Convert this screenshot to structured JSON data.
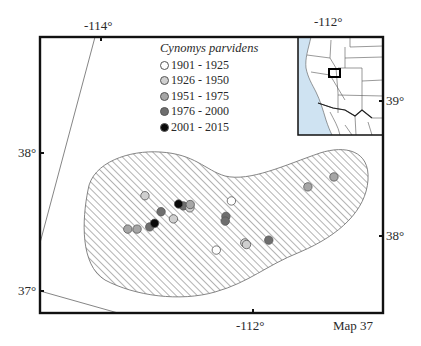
{
  "map": {
    "label": "Map 37",
    "species": "Cynomys parvidens",
    "axis_labels": {
      "top_left_lon": "-114°",
      "top_right_lon": "-112°",
      "bottom_lon": "-112°",
      "left_lat_upper": "38°",
      "left_lat_lower": "37°",
      "right_lat_upper": "39°",
      "right_lat_lower": "38°"
    },
    "legend": [
      {
        "label": "1901 - 1925",
        "color": "#ffffff"
      },
      {
        "label": "1926 - 1950",
        "color": "#cfcfcf"
      },
      {
        "label": "1951 - 1975",
        "color": "#a6a6a6"
      },
      {
        "label": "1976 - 2000",
        "color": "#6e6e6e"
      },
      {
        "label": "2001 - 2015",
        "color": "#0a0a0a"
      }
    ],
    "range_fill": "hatched",
    "inset_water_color": "#cfe3f2",
    "records": [
      {
        "period": 2,
        "x": 0.306,
        "y": 0.575
      },
      {
        "period": 3,
        "x": 0.256,
        "y": 0.696
      },
      {
        "period": 3,
        "x": 0.283,
        "y": 0.696
      },
      {
        "period": 4,
        "x": 0.32,
        "y": 0.688
      },
      {
        "period": 4,
        "x": 0.353,
        "y": 0.633
      },
      {
        "period": 4,
        "x": 0.418,
        "y": 0.612
      },
      {
        "period": 2,
        "x": 0.437,
        "y": 0.619
      },
      {
        "period": 3,
        "x": 0.438,
        "y": 0.607
      },
      {
        "period": 2,
        "x": 0.389,
        "y": 0.659
      },
      {
        "period": 5,
        "x": 0.334,
        "y": 0.675
      },
      {
        "period": 5,
        "x": 0.404,
        "y": 0.605
      },
      {
        "period": 1,
        "x": 0.558,
        "y": 0.594
      },
      {
        "period": 4,
        "x": 0.542,
        "y": 0.65
      },
      {
        "period": 4,
        "x": 0.54,
        "y": 0.667
      },
      {
        "period": 1,
        "x": 0.514,
        "y": 0.772
      },
      {
        "period": 2,
        "x": 0.597,
        "y": 0.746
      },
      {
        "period": 2,
        "x": 0.602,
        "y": 0.752
      },
      {
        "period": 4,
        "x": 0.667,
        "y": 0.736
      },
      {
        "period": 3,
        "x": 0.781,
        "y": 0.543
      },
      {
        "period": 3,
        "x": 0.857,
        "y": 0.507
      }
    ]
  }
}
